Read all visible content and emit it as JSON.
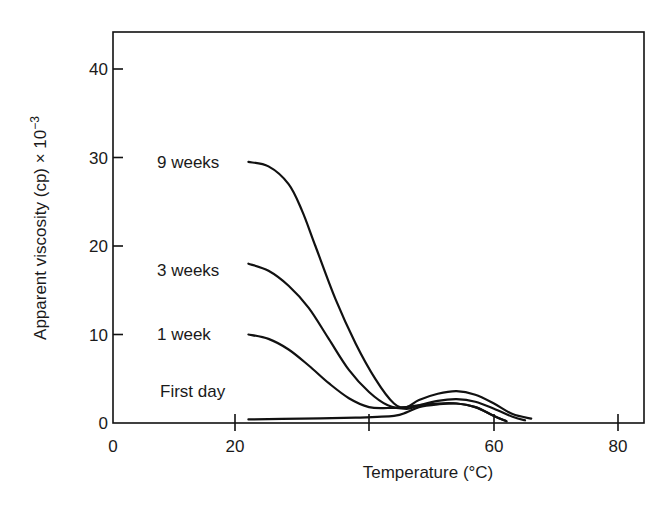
{
  "chart_data": {
    "type": "line",
    "title": "",
    "xlabel": "Temperature (°C)",
    "ylabel": "Apparent viscosity (cp) × 10⁻³",
    "ylabel_main": "Apparent viscosity (cp) × 10",
    "ylabel_exp": "−3",
    "xlim": [
      0,
      84
    ],
    "ylim": [
      0,
      44
    ],
    "x_ticks": [
      0,
      20,
      40,
      60,
      80
    ],
    "x_tick_labels": [
      "0",
      "20",
      "",
      "60",
      "80"
    ],
    "y_ticks": [
      0,
      10,
      20,
      30,
      40
    ],
    "y_tick_labels": [
      "0",
      "10",
      "20",
      "30",
      "40"
    ],
    "grid": false,
    "legend": "inline labels at curve starts",
    "series": [
      {
        "name": "9 weeks",
        "x": [
          22,
          25,
          28,
          30,
          32,
          35,
          38,
          41,
          44,
          46,
          48,
          51,
          54,
          57,
          60,
          63,
          66
        ],
        "y": [
          29.5,
          29,
          27,
          24,
          20,
          14,
          9,
          5,
          2.2,
          1.8,
          2.6,
          3.3,
          3.6,
          3.2,
          2.2,
          1.0,
          0.5
        ]
      },
      {
        "name": "3 weeks",
        "x": [
          22,
          25,
          28,
          31,
          34,
          37,
          40,
          43,
          46,
          48,
          51,
          54,
          57,
          60,
          63,
          65
        ],
        "y": [
          18,
          17.2,
          15.5,
          13,
          9.5,
          6,
          3.5,
          2,
          1.6,
          2.0,
          2.5,
          2.7,
          2.4,
          1.6,
          0.7,
          0.3
        ]
      },
      {
        "name": "1 week",
        "x": [
          22,
          25,
          28,
          31,
          34,
          37,
          40,
          43,
          46,
          48,
          51,
          54,
          57,
          60,
          62
        ],
        "y": [
          10,
          9.5,
          8.3,
          6.5,
          4.5,
          2.8,
          1.8,
          1.7,
          1.8,
          2.0,
          2.2,
          2.2,
          1.8,
          0.8,
          0.2
        ]
      },
      {
        "name": "First day",
        "x": [
          22,
          30,
          38,
          44,
          46,
          48,
          51,
          54,
          57,
          60,
          62
        ],
        "y": [
          0.4,
          0.5,
          0.6,
          0.8,
          1.2,
          1.8,
          2.1,
          2.2,
          1.8,
          0.8,
          0.2
        ]
      }
    ]
  }
}
